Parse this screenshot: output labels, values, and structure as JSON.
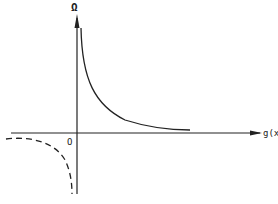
{
  "diagram": {
    "y_axis_label": "Ω",
    "x_axis_label": "g(x)",
    "origin_label": "O",
    "curves": [
      {
        "name": "positive-branch",
        "style": "solid",
        "quadrant": "I",
        "shape": "decreasing hyperbola approaching x-axis"
      },
      {
        "name": "negative-branch",
        "style": "dashed",
        "quadrant": "III",
        "shape": "curve diving toward negative y-axis"
      }
    ],
    "stroke_color": "#222222"
  }
}
